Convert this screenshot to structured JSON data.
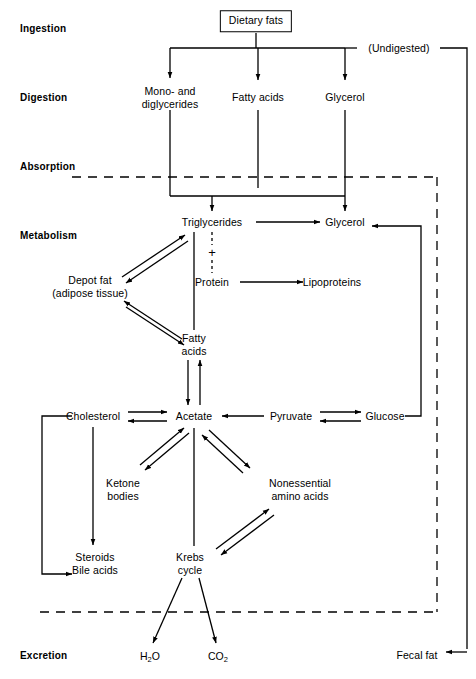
{
  "diagram": {
    "line_color": "#000000",
    "background": "#ffffff"
  },
  "stages": [
    {
      "label": "Ingestion",
      "x": 20,
      "y": 28
    },
    {
      "label": "Digestion",
      "x": 20,
      "y": 97
    },
    {
      "label": "Absorption",
      "x": 20,
      "y": 166
    },
    {
      "label": "Metabolism",
      "x": 20,
      "y": 235
    },
    {
      "label": "Excretion",
      "x": 20,
      "y": 655
    }
  ],
  "nodes": [
    {
      "id": "dietary_fats",
      "label": "Dietary fats",
      "x": 256,
      "y": 21,
      "boxed": true
    },
    {
      "id": "undigested",
      "label": "(Undigested)",
      "x": 399,
      "y": 48,
      "boxed": false
    },
    {
      "id": "monodi",
      "label": "Mono- and\ndiglycerides",
      "x": 170,
      "y": 97,
      "boxed": false
    },
    {
      "id": "fatty_acids_d",
      "label": "Fatty acids",
      "x": 258,
      "y": 97,
      "boxed": false
    },
    {
      "id": "glycerol_d",
      "label": "Glycerol",
      "x": 345,
      "y": 97,
      "boxed": false
    },
    {
      "id": "triglycerides",
      "label": "Triglycerides",
      "x": 212,
      "y": 222,
      "boxed": false
    },
    {
      "id": "glycerol_m",
      "label": "Glycerol",
      "x": 345,
      "y": 222,
      "boxed": false
    },
    {
      "id": "protein",
      "label": "Protein",
      "x": 212,
      "y": 282,
      "boxed": false
    },
    {
      "id": "lipoproteins",
      "label": "Lipoproteins",
      "x": 332,
      "y": 282,
      "boxed": false
    },
    {
      "id": "depot_fat",
      "label": "Depot fat\n(adipose tissue)",
      "x": 90,
      "y": 286,
      "boxed": false
    },
    {
      "id": "fatty_acids_m",
      "label": "Fatty\nacids",
      "x": 194,
      "y": 344,
      "boxed": false
    },
    {
      "id": "cholesterol",
      "label": "Cholesterol",
      "x": 93,
      "y": 416,
      "boxed": false
    },
    {
      "id": "acetate",
      "label": "Acetate",
      "x": 194,
      "y": 416,
      "boxed": false
    },
    {
      "id": "pyruvate",
      "label": "Pyruvate",
      "x": 291,
      "y": 416,
      "boxed": false
    },
    {
      "id": "glucose",
      "label": "Glucose",
      "x": 385,
      "y": 416,
      "boxed": false
    },
    {
      "id": "ketone_bodies",
      "label": "Ketone\nbodies",
      "x": 123,
      "y": 489,
      "boxed": false
    },
    {
      "id": "nonessential",
      "label": "Nonessential\namino acids",
      "x": 300,
      "y": 489,
      "boxed": false
    },
    {
      "id": "steroids",
      "label": "Steroids\nBile acids",
      "x": 95,
      "y": 563,
      "boxed": false
    },
    {
      "id": "krebs",
      "label": "Krebs\ncycle",
      "x": 190,
      "y": 563,
      "boxed": false
    },
    {
      "id": "water",
      "label": "H2O",
      "x": 150,
      "y": 657,
      "boxed": false
    },
    {
      "id": "co2",
      "label": "CO2",
      "x": 218,
      "y": 657,
      "boxed": false
    },
    {
      "id": "fecal_fat",
      "label": "Fecal fat",
      "x": 417,
      "y": 655,
      "boxed": false
    }
  ],
  "plus_sign": {
    "symbol": "+",
    "x": 212,
    "y": 252
  },
  "relations": [
    {
      "from": "dietary_fats",
      "to": "monodi",
      "kind": "arrow"
    },
    {
      "from": "dietary_fats",
      "to": "fatty_acids_d",
      "kind": "arrow"
    },
    {
      "from": "dietary_fats",
      "to": "glycerol_d",
      "kind": "arrow"
    },
    {
      "from": "dietary_fats",
      "to": "undigested",
      "kind": "line"
    },
    {
      "from": "undigested",
      "to": "fecal_fat",
      "kind": "arrow"
    },
    {
      "from": "monodi",
      "to": "triglycerides",
      "kind": "arrow"
    },
    {
      "from": "fatty_acids_d",
      "to": "triglycerides",
      "kind": "arrow"
    },
    {
      "from": "glycerol_d",
      "to": "glycerol_m",
      "kind": "arrow"
    },
    {
      "from": "triglycerides",
      "to": "glycerol_m",
      "kind": "arrow"
    },
    {
      "from": "protein",
      "to": "triglycerides",
      "kind": "dashed-plus"
    },
    {
      "from": "protein",
      "to": "lipoproteins",
      "kind": "arrow"
    },
    {
      "from": "depot_fat",
      "to": "triglycerides",
      "kind": "double-arrow"
    },
    {
      "from": "depot_fat",
      "to": "fatty_acids_m",
      "kind": "double-arrow"
    },
    {
      "from": "triglycerides",
      "to": "fatty_acids_m",
      "kind": "line"
    },
    {
      "from": "fatty_acids_m",
      "to": "acetate",
      "kind": "double-arrow"
    },
    {
      "from": "cholesterol",
      "to": "acetate",
      "kind": "double-arrow"
    },
    {
      "from": "pyruvate",
      "to": "acetate",
      "kind": "arrow"
    },
    {
      "from": "pyruvate",
      "to": "glucose",
      "kind": "double-arrow"
    },
    {
      "from": "glucose",
      "to": "glycerol_m",
      "kind": "arrow"
    },
    {
      "from": "cholesterol",
      "to": "steroids",
      "kind": "arrow"
    },
    {
      "from": "cholesterol",
      "to": "steroids",
      "kind": "bracket-arrow"
    },
    {
      "from": "acetate",
      "to": "ketone_bodies",
      "kind": "double-arrow"
    },
    {
      "from": "acetate",
      "to": "nonessential",
      "kind": "double-arrow"
    },
    {
      "from": "acetate",
      "to": "krebs",
      "kind": "line"
    },
    {
      "from": "krebs",
      "to": "nonessential",
      "kind": "double-arrow"
    },
    {
      "from": "krebs",
      "to": "water",
      "kind": "arrow"
    },
    {
      "from": "krebs",
      "to": "co2",
      "kind": "arrow"
    }
  ],
  "boundaries": [
    {
      "name": "absorption-boundary",
      "y": 177,
      "x1": 72,
      "x2": 437,
      "style": "dashed"
    },
    {
      "name": "excretion-boundary",
      "y": 612,
      "x1": 40,
      "x2": 437,
      "style": "dashed"
    }
  ]
}
